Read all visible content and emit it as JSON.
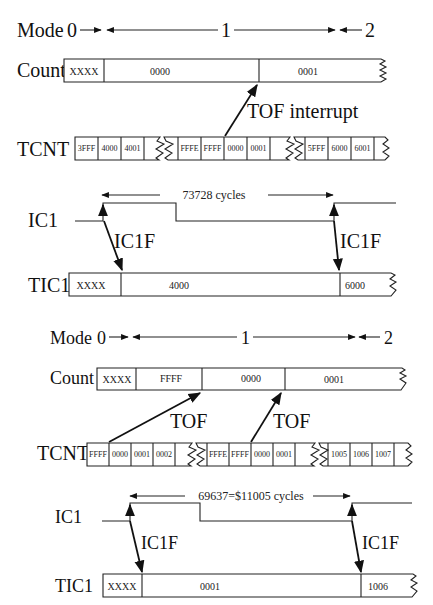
{
  "diagram_top": {
    "mode": {
      "label": "Mode",
      "m0": "0",
      "m1": "1",
      "m2": "2"
    },
    "count": {
      "label": "Count",
      "cells": [
        "XXXX",
        "0000",
        "0001"
      ]
    },
    "tof_annotation": "TOF interrupt",
    "tcnt": {
      "label": "TCNT",
      "group1": [
        "3FFF",
        "4000",
        "4001"
      ],
      "group2": [
        "FFFE",
        "FFFF",
        "0000",
        "0001"
      ],
      "group3": [
        "5FFF",
        "6000",
        "6001"
      ]
    },
    "ic1": {
      "label": "IC1",
      "period_text": "73728 cycles",
      "flag_left": "IC1F",
      "flag_right": "IC1F"
    },
    "tic1": {
      "label": "TIC1",
      "cells": [
        "XXXX",
        "4000",
        "6000"
      ]
    }
  },
  "diagram_bottom": {
    "mode": {
      "label": "Mode",
      "m0": "0",
      "m1": "1",
      "m2": "2"
    },
    "count": {
      "label": "Count",
      "cells": [
        "XXXX",
        "FFFF",
        "0000",
        "0001"
      ]
    },
    "tof_left": "TOF",
    "tof_right": "TOF",
    "tcnt": {
      "label": "TCNT",
      "group1": [
        "FFFF",
        "0000",
        "0001",
        "0002"
      ],
      "group2": [
        "FFFE",
        "FFFF",
        "0000",
        "0001"
      ],
      "group3": [
        "1005",
        "1006",
        "1007"
      ]
    },
    "ic1": {
      "label": "IC1",
      "period_text": "69637=$11005 cycles",
      "flag_left": "IC1F",
      "flag_right": "IC1F"
    },
    "tic1": {
      "label": "TIC1",
      "cells": [
        "XXXX",
        "0001",
        "1006"
      ]
    }
  }
}
